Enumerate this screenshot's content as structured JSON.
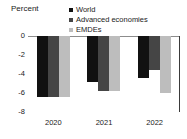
{
  "chart_data": {
    "type": "bar",
    "title": "",
    "subtitle": "",
    "xlabel": "",
    "ylabel": "Percent",
    "categories": [
      "2020",
      "2021",
      "2022"
    ],
    "series": [
      {
        "name": "World",
        "color": "#111111",
        "values": [
          -6.4,
          -4.8,
          -4.4
        ]
      },
      {
        "name": "Advanced economies",
        "color": "#454545",
        "values": [
          -6.4,
          -5.8,
          -3.6
        ]
      },
      {
        "name": "EMDEs",
        "color": "#bdbdbd",
        "values": [
          -6.4,
          -5.8,
          -6.0
        ]
      }
    ],
    "ylim": [
      -8,
      0
    ],
    "yticks": [
      "0",
      "-2",
      "-4",
      "-6",
      "-8"
    ],
    "ytick_values": [
      0,
      -2,
      -4,
      -6,
      -8
    ],
    "grid": false,
    "legend_position": "top-right",
    "zero_line": true
  },
  "axis": {
    "unit_label": "Percent"
  },
  "legend": {
    "items": [
      {
        "label": "World",
        "color": "#111111"
      },
      {
        "label": "Advanced economies",
        "color": "#454545"
      },
      {
        "label": "EMDEs",
        "color": "#bdbdbd"
      }
    ]
  }
}
